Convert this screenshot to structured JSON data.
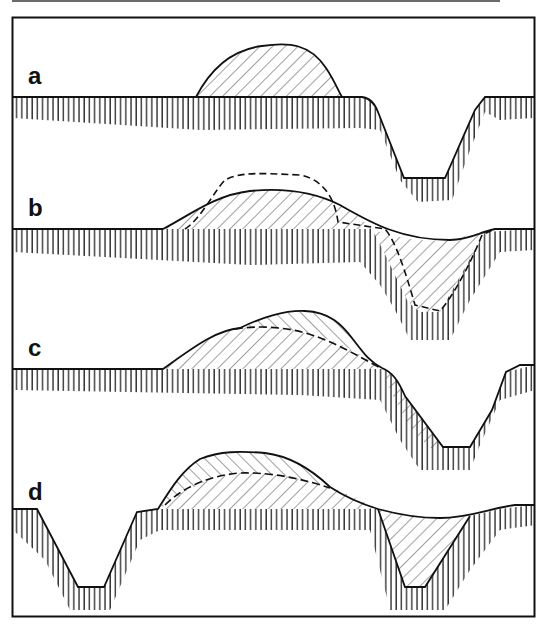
{
  "figure": {
    "frame_color": "#111111",
    "line_color": "#111111",
    "hatch_color": "#555555",
    "panels": [
      {
        "label": "a",
        "ground_y": 97
      },
      {
        "label": "b",
        "ground_y": 229
      },
      {
        "label": "c",
        "ground_y": 369
      },
      {
        "label": "d",
        "ground_y": 509
      }
    ]
  }
}
